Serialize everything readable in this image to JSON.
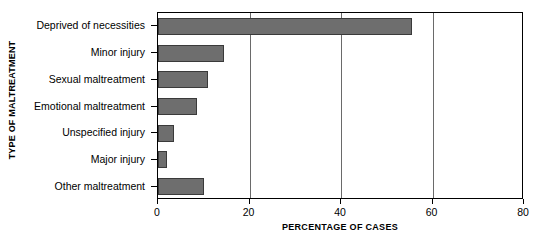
{
  "chart_data": {
    "type": "bar",
    "orientation": "horizontal",
    "title": "",
    "xlabel": "PERCENTAGE OF CASES",
    "ylabel": "TYPE OF MALTREATMENT",
    "categories": [
      "Deprived of necessities",
      "Minor injury",
      "Sexual maltreatment",
      "Emotional maltreatment",
      "Unspecified injury",
      "Major injury",
      "Other maltreatment"
    ],
    "values": [
      55.5,
      14.5,
      11.0,
      8.5,
      3.5,
      2.0,
      10.0
    ],
    "xlim": [
      0,
      80
    ],
    "xticks": [
      0,
      20,
      40,
      60,
      80
    ],
    "xtick_labels": [
      "0",
      "20",
      "40",
      "60",
      "80"
    ],
    "grid": "vertical",
    "legend": "none",
    "bar_color": "#6e6e6e",
    "bar_edge_color": "#3a3a3a",
    "frame_color": "#000000",
    "background": "#ffffff"
  }
}
